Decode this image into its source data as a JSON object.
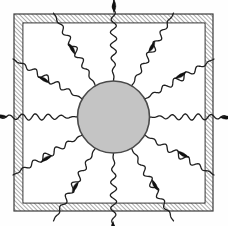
{
  "figure": {
    "caption": "",
    "width": 228,
    "height": 226,
    "background_color": "#fefefe"
  },
  "colors": {
    "background": "#fefefe",
    "enclosure_hatch_line": "#555555",
    "enclosure_hatch_fill": "#ffffff",
    "enclosure_outline": "#3a3a3a",
    "cavity_fill": "#ffffff",
    "sphere_fill": "#c4c4c4",
    "sphere_outline": "#4a4a4a",
    "ray_line": "#1f1f1f",
    "arrowhead_fill": "#111111"
  },
  "enclosure": {
    "label": "enclosure-wall",
    "outer": {
      "x": 14,
      "y": 14,
      "width": 199,
      "height": 197
    },
    "inner": {
      "x": 23,
      "y": 23,
      "width": 182,
      "height": 180
    },
    "wall_thickness": 9,
    "hatch_angle_deg": 45,
    "hatch_spacing_px": 3,
    "hatch_stroke_width": 1
  },
  "sphere": {
    "label": "central-sphere",
    "center_x": 113.5,
    "center_y": 117,
    "radius": 36,
    "fill": "#c4c4c4",
    "stroke_width": 1.6
  },
  "rays": {
    "label": "radiation-rays",
    "count": 12,
    "angle_step_deg": 30,
    "start_radius": 36,
    "waveform": "sinusoidal",
    "wave_amplitude_px": 3.2,
    "wave_period_px": 13,
    "stroke_width": 1.3,
    "arrowhead_shape": "elongated-dart",
    "arrowhead_length_px": 13,
    "arrowhead_width_px": 4.4,
    "items": [
      {
        "name": "ray-east",
        "angle_deg": 0,
        "length": 86,
        "arrow_at_fraction": 0.97
      },
      {
        "name": "ray-east-northeast",
        "angle_deg": 30,
        "length": 80,
        "arrow_at_fraction": 0.62
      },
      {
        "name": "ray-north-northeast",
        "angle_deg": 60,
        "length": 84,
        "arrow_at_fraction": 0.6
      },
      {
        "name": "ray-north",
        "angle_deg": 90,
        "length": 84,
        "arrow_at_fraction": 0.97
      },
      {
        "name": "ray-north-northwest",
        "angle_deg": 120,
        "length": 84,
        "arrow_at_fraction": 0.6
      },
      {
        "name": "ray-west-northwest",
        "angle_deg": 150,
        "length": 80,
        "arrow_at_fraction": 0.62
      },
      {
        "name": "ray-west",
        "angle_deg": 180,
        "length": 86,
        "arrow_at_fraction": 0.97
      },
      {
        "name": "ray-west-southwest",
        "angle_deg": 210,
        "length": 80,
        "arrow_at_fraction": 0.62
      },
      {
        "name": "ray-south-southwest",
        "angle_deg": 240,
        "length": 84,
        "arrow_at_fraction": 0.6
      },
      {
        "name": "ray-south",
        "angle_deg": 270,
        "length": 84,
        "arrow_at_fraction": 0.97
      },
      {
        "name": "ray-south-southeast",
        "angle_deg": 300,
        "length": 84,
        "arrow_at_fraction": 0.6
      },
      {
        "name": "ray-east-southeast",
        "angle_deg": 330,
        "length": 80,
        "arrow_at_fraction": 0.62
      }
    ]
  }
}
